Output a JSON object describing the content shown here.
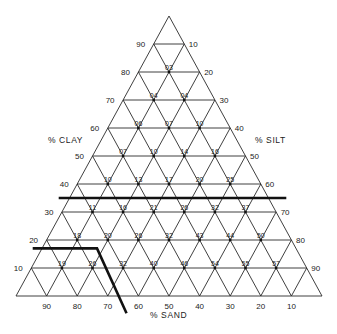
{
  "diagram": {
    "type": "ternary-triangle",
    "axes": {
      "clay": {
        "title": "% CLAY",
        "ticks": [
          "10",
          "20",
          "30",
          "40",
          "50",
          "60",
          "70",
          "80",
          "90"
        ]
      },
      "silt": {
        "title": "% SILT",
        "ticks": [
          "10",
          "20",
          "30",
          "40",
          "50",
          "60",
          "70",
          "80",
          "90"
        ]
      },
      "sand": {
        "title": "% SAND",
        "ticks": [
          "90",
          "80",
          "70",
          "60",
          "50",
          "40",
          "30",
          "20",
          "10"
        ]
      }
    },
    "rows": [
      {
        "clay": 80,
        "values": [
          "03"
        ]
      },
      {
        "clay": 70,
        "values": [
          "04",
          "04"
        ]
      },
      {
        "clay": 60,
        "values": [
          "06",
          "07",
          "10"
        ]
      },
      {
        "clay": 50,
        "values": [
          "07",
          "10",
          "14",
          "16"
        ]
      },
      {
        "clay": 40,
        "values": [
          "10",
          "13",
          "17",
          "20",
          "25"
        ]
      },
      {
        "clay": 30,
        "values": [
          "11",
          "16",
          "21",
          "26",
          "32",
          "37"
        ]
      },
      {
        "clay": 20,
        "values": [
          "18",
          "20",
          "26",
          "32",
          "43",
          "44",
          "50"
        ]
      },
      {
        "clay": 10,
        "values": [
          "19",
          "26",
          "32",
          "40",
          "46",
          "54",
          "55",
          "57"
        ]
      }
    ],
    "boundaries": [
      {
        "name": "clay-35-line",
        "description": "horizontal line at about 35% clay"
      },
      {
        "name": "sandy-boundary",
        "description": "line at about 17% clay bending down toward about 65% sand"
      }
    ]
  }
}
